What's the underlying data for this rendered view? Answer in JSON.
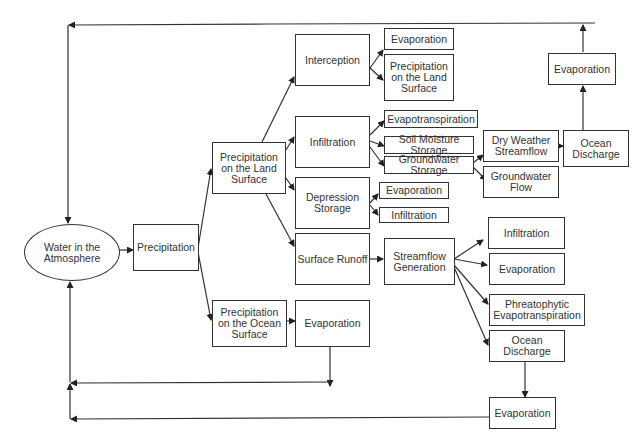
{
  "diagram": {
    "nodes": {
      "atmosphere": "Water in the\nAtmosphere",
      "precipitation": "Precipitation",
      "precip_land": "Precipitation\non the Land\nSurface",
      "precip_ocean": "Precipitation\non the Ocean\nSurface",
      "interception": "Interception",
      "infiltration": "Infiltration",
      "depression_storage": "Depression\nStorage",
      "surface_runoff": "Surface Runoff",
      "ocean_evaporation": "Evaporation",
      "interception_evaporation": "Evaporation",
      "interception_precip_land": "Precipitation\non the Land\nSurface",
      "evapotranspiration": "Evapotranspiration",
      "soil_moisture_storage": "Soil Moisture Storage",
      "groundwater_storage": "Groundwater Storage",
      "depression_evaporation": "Evaporation",
      "depression_infiltration": "Infiltration",
      "dry_weather_streamflow": "Dry Weather\nStreamflow",
      "groundwater_flow": "Groundwater\nFlow",
      "ocean_discharge_top": "Ocean\nDischarge",
      "evaporation_top": "Evaporation",
      "streamflow_generation": "Streamflow\nGeneration",
      "sf_infiltration": "Infiltration",
      "sf_evaporation": "Evaporation",
      "phreatophytic": "Phreatophytic\nEvapotranspiration",
      "ocean_discharge_bottom": "Ocean\nDischarge",
      "evaporation_bottom": "Evaporation"
    },
    "colors": {
      "line": "#333333",
      "background": "#ffffff"
    }
  }
}
